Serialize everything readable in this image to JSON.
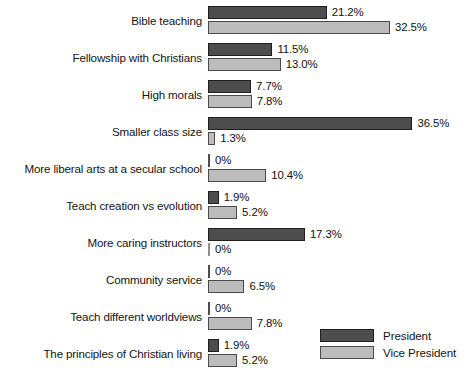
{
  "chart_data": {
    "type": "bar",
    "orientation": "horizontal",
    "title": "",
    "subtitle": "",
    "xlabel": "",
    "ylabel": "",
    "xlim": [
      0,
      36.5
    ],
    "grid": false,
    "legend_position": "bottom-right",
    "value_suffix": "%",
    "categories": [
      "Bible teaching",
      "Fellowship with Christians",
      "High morals",
      "Smaller class size",
      "More liberal arts at a secular school",
      "Teach creation vs evolution",
      "More caring instructors",
      "Community service",
      "Teach different worldviews",
      "The principles of Christian living"
    ],
    "series": [
      {
        "name": "President",
        "color": "#4d4d4d",
        "values": [
          21.2,
          11.5,
          7.7,
          36.5,
          0,
          1.9,
          17.3,
          0,
          0,
          1.9
        ],
        "labels": [
          "21.2%",
          "11.5%",
          "7.7%",
          "36.5%",
          "0%",
          "1.9%",
          "17.3%",
          "0%",
          "0%",
          "1.9%"
        ]
      },
      {
        "name": "Vice President",
        "color": "#bcbcbc",
        "values": [
          32.5,
          13.0,
          7.8,
          1.3,
          10.4,
          5.2,
          0,
          6.5,
          7.8,
          5.2
        ],
        "labels": [
          "32.5%",
          "13.0%",
          "7.8%",
          "1.3%",
          "10.4%",
          "5.2%",
          "0%",
          "6.5%",
          "7.8%",
          "5.2%"
        ]
      }
    ]
  },
  "legend": {
    "items": [
      {
        "label": "President",
        "color": "#4d4d4d"
      },
      {
        "label": "Vice President",
        "color": "#bcbcbc"
      }
    ]
  }
}
